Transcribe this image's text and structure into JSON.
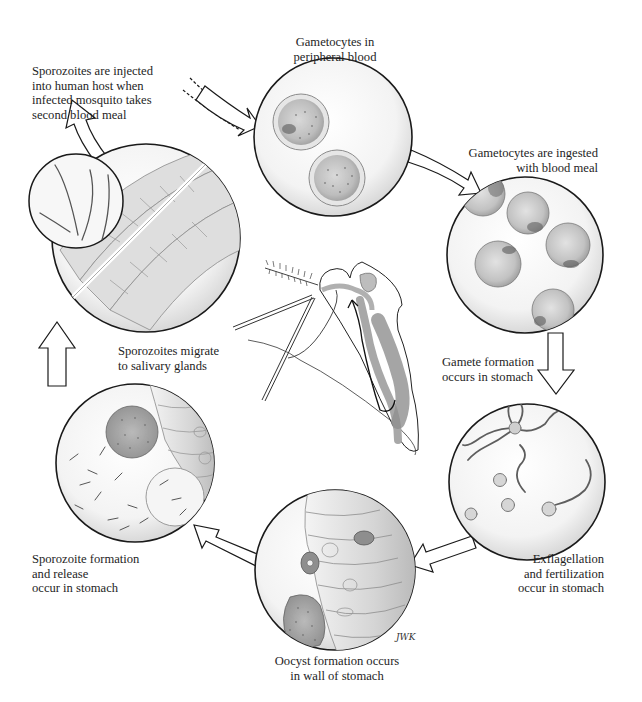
{
  "figure": {
    "signature": "JWK",
    "colors": {
      "background": "#ffffff",
      "outline": "#1a1a1a",
      "circle_fill": "#f1f1f1",
      "cell_fill": "#c9c9c9",
      "cell_dark": "#7d7d7d",
      "tissue_fill": "#d8d8d8",
      "text": "#1e1e1e"
    }
  },
  "stages": [
    {
      "id": "gametocytes-peripheral-blood",
      "label": "Gametocytes in\nperipheral blood"
    },
    {
      "id": "gametocytes-ingested",
      "label": "Gametocytes are ingested\nwith blood meal"
    },
    {
      "id": "gamete-formation",
      "label": "Gamete formation\noccurs in stomach"
    },
    {
      "id": "exflagellation-fertilization",
      "label": "Exflagellation\nand fertilization\noccur in stomach"
    },
    {
      "id": "oocyst-formation",
      "label": "Oocyst formation occurs\nin wall of stomach"
    },
    {
      "id": "sporozoite-formation",
      "label": "Sporozoite formation\nand release\noccur in stomach"
    },
    {
      "id": "sporozoites-migrate",
      "label": "Sporozoites migrate\nto salivary glands"
    },
    {
      "id": "sporozoites-injected",
      "label": "Sporozoites are injected\ninto human host when\ninfected mosquito takes\nsecond blood meal"
    }
  ],
  "center_illustration": "mosquito-anatomy-cross-section"
}
